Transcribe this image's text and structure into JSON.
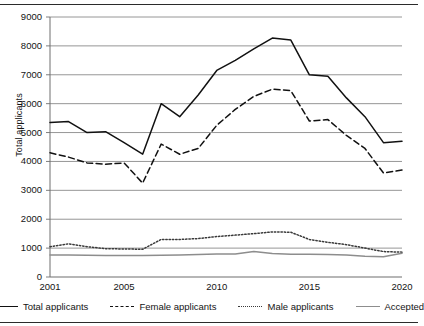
{
  "chart_data": {
    "type": "line",
    "title": "",
    "xlabel": "",
    "ylabel": "Total applicants",
    "xlim": [
      2001,
      2020
    ],
    "ylim": [
      0,
      9000
    ],
    "ytick_step": 1000,
    "grid": true,
    "legend_position": "bottom",
    "x": [
      2001,
      2002,
      2003,
      2004,
      2005,
      2006,
      2007,
      2008,
      2009,
      2010,
      2011,
      2012,
      2013,
      2014,
      2015,
      2016,
      2017,
      2018,
      2019,
      2020
    ],
    "xticks": [
      "2001",
      "2005",
      "2010",
      "2015",
      "2020"
    ],
    "yticks": [
      "0",
      "1000",
      "2000",
      "3000",
      "4000",
      "5000",
      "6000",
      "7000",
      "8000",
      "9000"
    ],
    "series": [
      {
        "name": "Total applicants",
        "style": "solid",
        "color": "#111111",
        "values": [
          5350,
          5380,
          5000,
          5030,
          4650,
          4250,
          6000,
          5550,
          6300,
          7150,
          7500,
          7900,
          8270,
          8200,
          7000,
          6950,
          6200,
          5550,
          4650,
          4700
        ]
      },
      {
        "name": "Female applicants",
        "style": "dashed",
        "color": "#111111",
        "values": [
          4300,
          4150,
          3950,
          3900,
          3950,
          3250,
          4600,
          4250,
          4450,
          5250,
          5800,
          6250,
          6500,
          6450,
          5400,
          5450,
          4900,
          4450,
          3600,
          3700
        ]
      },
      {
        "name": "Male applicants",
        "style": "dotted",
        "color": "#3a3a3a",
        "values": [
          1050,
          1150,
          1050,
          980,
          970,
          960,
          1300,
          1300,
          1330,
          1400,
          1450,
          1500,
          1560,
          1550,
          1300,
          1200,
          1120,
          1000,
          880,
          860
        ]
      },
      {
        "name": "Accepted",
        "style": "solid-gray",
        "color": "#8d8d8d",
        "values": [
          760,
          760,
          750,
          745,
          740,
          740,
          750,
          760,
          780,
          800,
          800,
          880,
          810,
          790,
          790,
          780,
          760,
          720,
          700,
          820
        ]
      }
    ]
  },
  "legend": {
    "items": [
      {
        "label": "Total applicants",
        "swatch": "solid-line-swatch"
      },
      {
        "label": "Female applicants",
        "swatch": "dashed-line-swatch"
      },
      {
        "label": "Male applicants",
        "swatch": "dotted-line-swatch"
      },
      {
        "label": "Accepted",
        "swatch": "gray-line-swatch"
      }
    ]
  }
}
